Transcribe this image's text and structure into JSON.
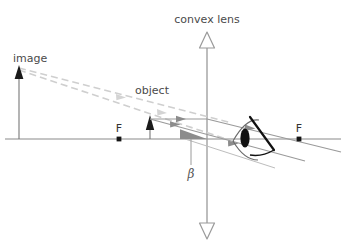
{
  "labels": {
    "lens": "convex lens",
    "image": "image",
    "object": "object",
    "focus_left": "F",
    "focus_right": "F",
    "angle": "β"
  },
  "colors": {
    "axis": "#8a8a8a",
    "lens_line": "#9a9a9a",
    "ray": "#8c8c8c",
    "dashed_ray": "#cccccc",
    "arrow_solid": "#1a1a1a",
    "angle_fill": "#8c8c8c",
    "eye_outline": "#5a5a5a",
    "pupil": "#111111",
    "text": "#4a4a4a",
    "background": "#ffffff"
  },
  "geometry": {
    "axis_y": 139,
    "axis_x_start": 5,
    "axis_x_end": 341,
    "lens_x": 207,
    "lens_top_y": 32,
    "lens_bottom_y": 239,
    "focus_left_x": 119,
    "focus_right_x": 299,
    "object_x": 150,
    "object_top_y": 119,
    "image_x": 19,
    "image_top_y": 67,
    "eye_x": 250,
    "eye_y": 139
  },
  "elements": {
    "lens_axis_name": "principal-axis",
    "lens_name": "convex-lens-line",
    "object_name": "object-arrow",
    "image_name": "image-arrow",
    "eye_name": "eye-icon",
    "angle_name": "angle-beta-wedge"
  }
}
